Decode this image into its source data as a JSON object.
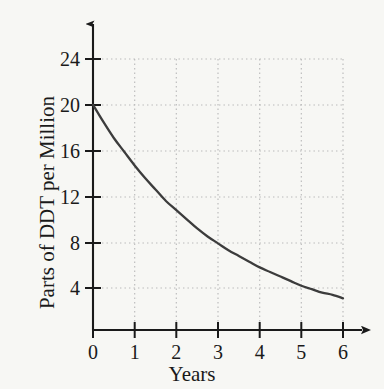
{
  "chart_data": {
    "type": "line",
    "title": "",
    "xlabel": "Years",
    "ylabel": "Parts of DDT per Million",
    "xlim": [
      0,
      6
    ],
    "ylim": [
      0,
      25
    ],
    "xticks": [
      0,
      1,
      2,
      3,
      4,
      5,
      6
    ],
    "xtick_labels": [
      "0",
      "1",
      "2",
      "3",
      "4",
      "5",
      "6"
    ],
    "yticks": [
      4,
      8,
      12,
      16,
      20,
      24
    ],
    "ytick_labels": [
      "4",
      "8",
      "12",
      "16",
      "20",
      "24"
    ],
    "grid": true,
    "grid_style": "dotted",
    "grid_color": "#b9b9b9",
    "legend": null,
    "series": [
      {
        "name": "DDT concentration",
        "color": "#3c3c3c",
        "x": [
          0,
          0.25,
          0.5,
          0.75,
          1,
          1.25,
          1.5,
          1.75,
          2,
          2.25,
          2.5,
          2.75,
          3,
          3.25,
          3.5,
          3.75,
          4,
          4.25,
          4.5,
          4.75,
          5,
          5.25,
          5.5,
          5.75,
          6
        ],
        "values": [
          20.0,
          18.5,
          17.1,
          15.9,
          14.7,
          13.6,
          12.6,
          11.6,
          10.8,
          10.0,
          9.2,
          8.5,
          7.9,
          7.3,
          6.8,
          6.3,
          5.8,
          5.4,
          5.0,
          4.6,
          4.2,
          3.9,
          3.6,
          3.4,
          3.1
        ]
      }
    ],
    "annotations": [],
    "axis_arrows": [
      "x-right",
      "y-up"
    ]
  },
  "axes": {
    "y_axis_name": "y-axis",
    "x_axis_name": "x-axis"
  },
  "colors": {
    "background": "#f7f7f4",
    "axis": "#1a1a1a",
    "curve": "#3c3c3c",
    "grid": "#b9b9b9",
    "text": "#1a1a1a"
  }
}
